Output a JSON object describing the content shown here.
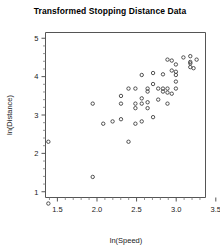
{
  "chart_data": {
    "type": "scatter",
    "title": "Transformed Stopping Distance Data",
    "xlabel": "ln(Speed)",
    "ylabel": "ln(Distance)",
    "xlim": [
      1.35,
      3.37
    ],
    "ylim": [
      0.85,
      5.15
    ],
    "xticks": [
      1.5,
      2.0,
      2.5,
      3.0,
      3.5
    ],
    "xtick_labels": [
      "1.5",
      "2.0",
      "2.5",
      "3.0",
      "3.5"
    ],
    "yticks": [
      1,
      2,
      3,
      4,
      5
    ],
    "ytick_labels": [
      "1",
      "2",
      "3",
      "4",
      "5"
    ],
    "x_minor_tick_step": 0.1,
    "y_minor_tick_step": 0.2,
    "grid": false,
    "legend": null,
    "marker": "open-circle",
    "marker_color": "#404040",
    "n_points": 50,
    "x": [
      1.386,
      1.386,
      1.946,
      1.946,
      2.079,
      2.197,
      2.303,
      2.303,
      2.303,
      2.398,
      2.398,
      2.485,
      2.485,
      2.485,
      2.485,
      2.565,
      2.565,
      2.565,
      2.565,
      2.639,
      2.639,
      2.639,
      2.639,
      2.708,
      2.708,
      2.708,
      2.773,
      2.773,
      2.833,
      2.833,
      2.833,
      2.89,
      2.89,
      2.89,
      2.89,
      2.944,
      2.944,
      2.944,
      2.996,
      2.996,
      2.996,
      2.996,
      2.996,
      3.091,
      3.178,
      3.178,
      3.178,
      3.178,
      3.219,
      3.258
    ],
    "y": [
      0.693,
      2.303,
      1.386,
      3.296,
      2.773,
      2.833,
      2.89,
      3.296,
      3.497,
      2.303,
      3.689,
      2.773,
      3.178,
      3.296,
      3.689,
      2.833,
      3.296,
      3.434,
      4.043,
      3.178,
      3.332,
      3.611,
      3.689,
      2.944,
      3.807,
      4.094,
      3.401,
      3.689,
      3.611,
      3.689,
      4.06,
      3.296,
      3.584,
      3.689,
      4.443,
      3.555,
      4.159,
      4.419,
      3.689,
      3.871,
      4.043,
      4.127,
      4.317,
      4.5,
      4.248,
      4.344,
      4.382,
      4.533,
      4.22,
      4.443
    ],
    "points": [
      {
        "x": 1.386,
        "y": 0.693
      },
      {
        "x": 1.386,
        "y": 2.303
      },
      {
        "x": 1.946,
        "y": 1.386
      },
      {
        "x": 1.946,
        "y": 3.296
      },
      {
        "x": 2.079,
        "y": 2.773
      },
      {
        "x": 2.197,
        "y": 2.833
      },
      {
        "x": 2.303,
        "y": 2.89
      },
      {
        "x": 2.303,
        "y": 3.296
      },
      {
        "x": 2.303,
        "y": 3.497
      },
      {
        "x": 2.398,
        "y": 2.303
      },
      {
        "x": 2.398,
        "y": 3.689
      },
      {
        "x": 2.485,
        "y": 2.773
      },
      {
        "x": 2.485,
        "y": 3.178
      },
      {
        "x": 2.485,
        "y": 3.296
      },
      {
        "x": 2.485,
        "y": 3.689
      },
      {
        "x": 2.565,
        "y": 2.833
      },
      {
        "x": 2.565,
        "y": 3.296
      },
      {
        "x": 2.565,
        "y": 3.434
      },
      {
        "x": 2.565,
        "y": 4.043
      },
      {
        "x": 2.639,
        "y": 3.178
      },
      {
        "x": 2.639,
        "y": 3.332
      },
      {
        "x": 2.639,
        "y": 3.611
      },
      {
        "x": 2.639,
        "y": 3.689
      },
      {
        "x": 2.708,
        "y": 2.944
      },
      {
        "x": 2.708,
        "y": 3.807
      },
      {
        "x": 2.708,
        "y": 4.094
      },
      {
        "x": 2.773,
        "y": 3.401
      },
      {
        "x": 2.773,
        "y": 3.689
      },
      {
        "x": 2.833,
        "y": 3.611
      },
      {
        "x": 2.833,
        "y": 3.689
      },
      {
        "x": 2.833,
        "y": 4.06
      },
      {
        "x": 2.89,
        "y": 3.296
      },
      {
        "x": 2.89,
        "y": 3.584
      },
      {
        "x": 2.89,
        "y": 3.689
      },
      {
        "x": 2.89,
        "y": 4.443
      },
      {
        "x": 2.944,
        "y": 3.555
      },
      {
        "x": 2.944,
        "y": 4.159
      },
      {
        "x": 2.944,
        "y": 4.419
      },
      {
        "x": 2.996,
        "y": 3.689
      },
      {
        "x": 2.996,
        "y": 3.871
      },
      {
        "x": 2.996,
        "y": 4.043
      },
      {
        "x": 2.996,
        "y": 4.127
      },
      {
        "x": 2.996,
        "y": 4.317
      },
      {
        "x": 3.091,
        "y": 4.5
      },
      {
        "x": 3.178,
        "y": 4.248
      },
      {
        "x": 3.178,
        "y": 4.344
      },
      {
        "x": 3.178,
        "y": 4.382
      },
      {
        "x": 3.178,
        "y": 4.533
      },
      {
        "x": 3.219,
        "y": 4.22
      },
      {
        "x": 3.258,
        "y": 4.443
      }
    ]
  }
}
